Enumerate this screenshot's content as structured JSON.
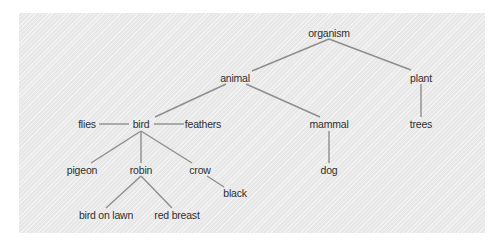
{
  "diagram": {
    "title": "",
    "type": "semantic network / concept hierarchy",
    "colors": {
      "panel_background": "#ebebeb",
      "page_background": "#ffffff",
      "edge": "#8e8e8e",
      "text": "#2e2e2e"
    },
    "nodes": {
      "organism": "organism",
      "animal": "animal",
      "plant": "plant",
      "bird": "bird",
      "flies": "flies",
      "feathers": "feathers",
      "mammal": "mammal",
      "trees": "trees",
      "pigeon": "pigeon",
      "robin": "robin",
      "crow": "crow",
      "dog": "dog",
      "black": "black",
      "bird_on_lawn": "bird on lawn",
      "red_breast": "red breast"
    },
    "edges": [
      [
        "organism",
        "animal"
      ],
      [
        "organism",
        "plant"
      ],
      [
        "animal",
        "bird"
      ],
      [
        "animal",
        "mammal"
      ],
      [
        "plant",
        "trees"
      ],
      [
        "bird",
        "flies"
      ],
      [
        "bird",
        "feathers"
      ],
      [
        "bird",
        "pigeon"
      ],
      [
        "bird",
        "robin"
      ],
      [
        "bird",
        "crow"
      ],
      [
        "mammal",
        "dog"
      ],
      [
        "crow",
        "black"
      ],
      [
        "robin",
        "bird_on_lawn"
      ],
      [
        "robin",
        "red_breast"
      ]
    ]
  }
}
